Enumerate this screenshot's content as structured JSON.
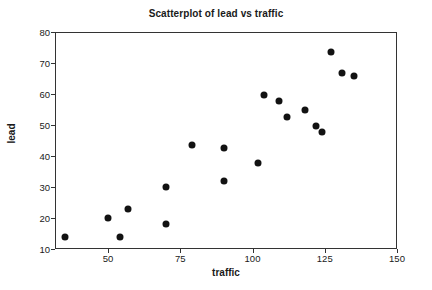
{
  "chart_data": {
    "type": "scatter",
    "title": "Scatterplot of lead vs traffic",
    "xlabel": "traffic",
    "ylabel": "lead",
    "xlim": [
      32,
      150
    ],
    "ylim": [
      9,
      80
    ],
    "xticks": [
      50,
      75,
      100,
      125,
      150
    ],
    "yticks": [
      10,
      20,
      30,
      40,
      50,
      60,
      70,
      80
    ],
    "grid": false,
    "legend": null,
    "marker": "filled-circle",
    "marker_color": "#121212",
    "series": [
      {
        "name": "lead vs traffic",
        "points": [
          {
            "x": 35,
            "y": 14.0
          },
          {
            "x": 50,
            "y": 20.1
          },
          {
            "x": 54,
            "y": 13.9
          },
          {
            "x": 57,
            "y": 22.8
          },
          {
            "x": 70,
            "y": 30.0
          },
          {
            "x": 70,
            "y": 18.2
          },
          {
            "x": 79,
            "y": 43.6
          },
          {
            "x": 90,
            "y": 42.7
          },
          {
            "x": 90,
            "y": 31.9
          },
          {
            "x": 102,
            "y": 37.9
          },
          {
            "x": 104,
            "y": 59.6
          },
          {
            "x": 109,
            "y": 57.8
          },
          {
            "x": 112,
            "y": 52.6
          },
          {
            "x": 118,
            "y": 54.8
          },
          {
            "x": 122,
            "y": 49.7
          },
          {
            "x": 124,
            "y": 47.9
          },
          {
            "x": 127,
            "y": 73.6
          },
          {
            "x": 131,
            "y": 66.9
          },
          {
            "x": 135,
            "y": 65.8
          }
        ]
      }
    ]
  },
  "colors": {
    "marker": "#121212",
    "axis": "#333333",
    "text": "#1a1a1a",
    "background": "#ffffff"
  }
}
